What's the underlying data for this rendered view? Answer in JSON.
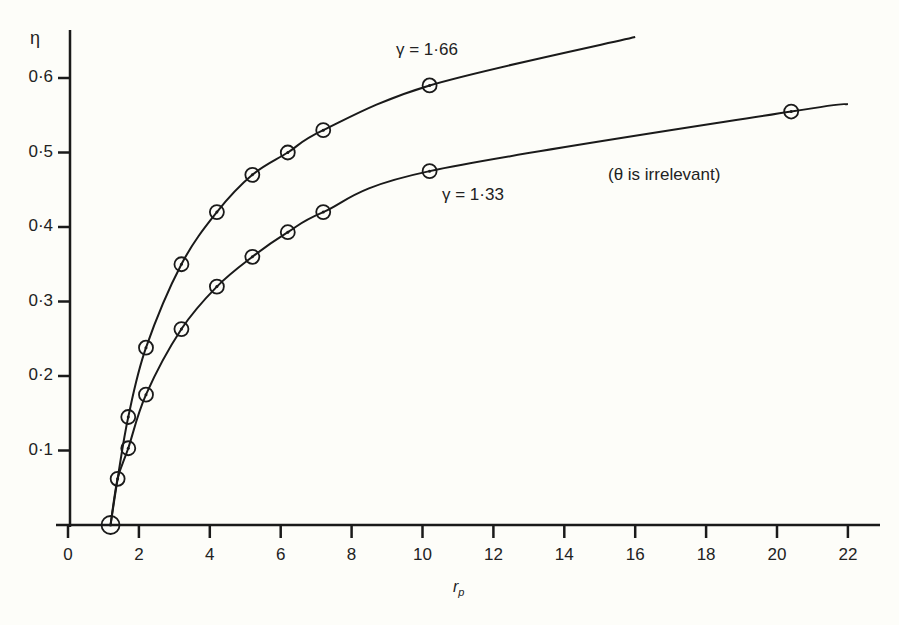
{
  "chart_data": {
    "type": "line",
    "title": "",
    "xlabel": "r_p",
    "ylabel": "η",
    "xlim": [
      0,
      23
    ],
    "ylim": [
      0,
      0.65
    ],
    "x_ticks": [
      "0",
      "2",
      "4",
      "6",
      "8",
      "10",
      "12",
      "14",
      "16",
      "18",
      "20",
      "22"
    ],
    "y_ticks": [
      "0·1",
      "0·2",
      "0·3",
      "0·4",
      "0·5",
      "0·6"
    ],
    "grid": false,
    "annotation": "(θ is irrelevant)",
    "series": [
      {
        "name": "γ = 1·66",
        "points": [
          [
            1.2,
            0.0
          ],
          [
            1.4,
            0.062
          ],
          [
            1.7,
            0.145
          ],
          [
            2.2,
            0.238
          ],
          [
            3.2,
            0.35
          ],
          [
            4.2,
            0.42
          ],
          [
            5.2,
            0.47
          ],
          [
            6.2,
            0.5
          ],
          [
            7.2,
            0.53
          ],
          [
            10.2,
            0.59
          ]
        ],
        "curve_end": [
          16.0,
          0.655
        ]
      },
      {
        "name": "γ = 1·33",
        "points": [
          [
            1.2,
            0.0
          ],
          [
            1.4,
            0.062
          ],
          [
            1.7,
            0.103
          ],
          [
            2.2,
            0.175
          ],
          [
            3.2,
            0.263
          ],
          [
            4.2,
            0.32
          ],
          [
            5.2,
            0.36
          ],
          [
            6.2,
            0.393
          ],
          [
            7.2,
            0.42
          ],
          [
            10.2,
            0.475
          ],
          [
            20.4,
            0.555
          ]
        ],
        "curve_end": [
          22.0,
          0.565
        ]
      }
    ]
  },
  "labels": {
    "y_axis": "η",
    "x_axis_main": "r",
    "x_axis_sub": "p",
    "series1": "γ = 1·66",
    "series2": "γ = 1·33",
    "note": "(θ is irrelevant)"
  }
}
